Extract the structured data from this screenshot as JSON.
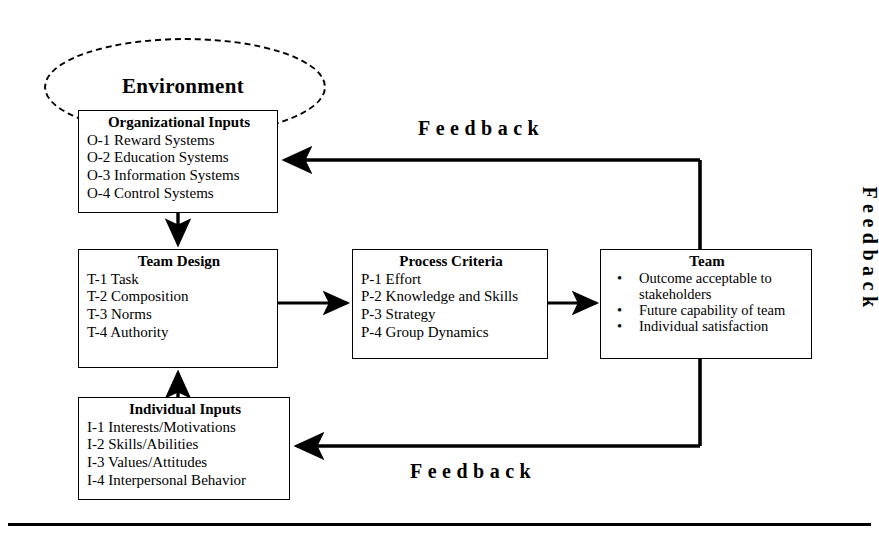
{
  "diagram": {
    "environment": {
      "label": "Environment",
      "shape": "dashed-cloud"
    },
    "nodes": [
      {
        "id": "organizational-inputs",
        "title": "Organizational Inputs",
        "lines": [
          "O-1 Reward Systems",
          "O-2 Education Systems",
          "O-3 Information Systems",
          "O-4 Control Systems"
        ]
      },
      {
        "id": "team-design",
        "title": "Team Design",
        "lines": [
          "T-1 Task",
          "T-2 Composition",
          "T-3 Norms",
          "T-4 Authority"
        ]
      },
      {
        "id": "process-criteria",
        "title": "Process Criteria",
        "lines": [
          "P-1 Effort",
          "P-2 Knowledge and Skills",
          "P-3 Strategy",
          "P-4 Group Dynamics"
        ]
      },
      {
        "id": "team",
        "title": "Team",
        "bullet_marker": "•",
        "bullets": [
          "Outcome acceptable to stakeholders",
          "Future capability of team",
          "Individual satisfaction"
        ]
      },
      {
        "id": "individual-inputs",
        "title": "Individual Inputs",
        "lines": [
          "I-1 Interests/Motivations",
          "I-2 Skills/Abilities",
          "I-3 Values/Attitudes",
          "I-4 Interpersonal Behavior"
        ]
      }
    ],
    "feedback_labels": {
      "top": "Feedback",
      "bottom": "Feedback",
      "right": "Feedback"
    },
    "connectors": [
      {
        "id": "org-to-team-design",
        "from": "organizational-inputs",
        "to": "team-design",
        "direction": "down",
        "arrow": true
      },
      {
        "id": "individual-to-team-design",
        "from": "individual-inputs",
        "to": "team-design",
        "direction": "up",
        "arrow": true
      },
      {
        "id": "team-design-to-process",
        "from": "team-design",
        "to": "process-criteria",
        "direction": "right",
        "arrow": true
      },
      {
        "id": "process-to-team",
        "from": "process-criteria",
        "to": "team",
        "direction": "right",
        "arrow": true
      },
      {
        "id": "feedback-top-path",
        "from": "team",
        "to": "organizational-inputs",
        "direction": "left",
        "arrow": true
      },
      {
        "id": "feedback-bottom-path",
        "from": "team",
        "to": "individual-inputs",
        "direction": "left",
        "arrow": true
      }
    ],
    "colors": {
      "stroke": "#000000",
      "background": "#ffffff",
      "environment_outline": "#000000"
    }
  }
}
